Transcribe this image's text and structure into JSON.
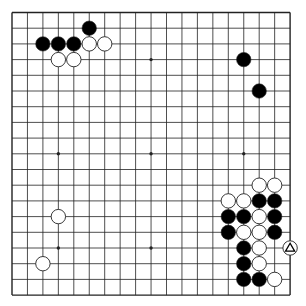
{
  "board": {
    "size": 19,
    "origin_x": 12,
    "origin_y": 12.5,
    "step_x": 15.45,
    "step_y": 15.7,
    "stone_radius": 7.2,
    "colors": {
      "background": "#ffffff",
      "line": "#222222",
      "black": "#000000",
      "white": "#ffffff",
      "stone_outline": "#222222"
    },
    "star_points": [
      [
        3,
        3
      ],
      [
        9,
        3
      ],
      [
        15,
        3
      ],
      [
        3,
        9
      ],
      [
        9,
        9
      ],
      [
        15,
        9
      ],
      [
        3,
        15
      ],
      [
        9,
        15
      ],
      [
        15,
        15
      ]
    ],
    "stones": [
      {
        "color": "black",
        "col": 5,
        "row": 1
      },
      {
        "color": "black",
        "col": 2,
        "row": 2
      },
      {
        "color": "black",
        "col": 3,
        "row": 2
      },
      {
        "color": "black",
        "col": 4,
        "row": 2
      },
      {
        "color": "white",
        "col": 5,
        "row": 2
      },
      {
        "color": "white",
        "col": 6,
        "row": 2
      },
      {
        "color": "white",
        "col": 3,
        "row": 3
      },
      {
        "color": "white",
        "col": 4,
        "row": 3
      },
      {
        "color": "black",
        "col": 15,
        "row": 3
      },
      {
        "color": "black",
        "col": 16,
        "row": 5
      },
      {
        "color": "white",
        "col": 16,
        "row": 11
      },
      {
        "color": "white",
        "col": 17,
        "row": 11
      },
      {
        "color": "white",
        "col": 14,
        "row": 12
      },
      {
        "color": "white",
        "col": 15,
        "row": 12
      },
      {
        "color": "black",
        "col": 16,
        "row": 12
      },
      {
        "color": "black",
        "col": 17,
        "row": 12
      },
      {
        "color": "black",
        "col": 14,
        "row": 13
      },
      {
        "color": "black",
        "col": 15,
        "row": 13
      },
      {
        "color": "white",
        "col": 16,
        "row": 13
      },
      {
        "color": "black",
        "col": 17,
        "row": 13
      },
      {
        "color": "black",
        "col": 14,
        "row": 14
      },
      {
        "color": "white",
        "col": 15,
        "row": 14
      },
      {
        "color": "white",
        "col": 16,
        "row": 14
      },
      {
        "color": "black",
        "col": 17,
        "row": 14
      },
      {
        "color": "black",
        "col": 15,
        "row": 15
      },
      {
        "color": "white",
        "col": 16,
        "row": 15
      },
      {
        "color": "white",
        "col": 18,
        "row": 15,
        "marker": "triangle"
      },
      {
        "color": "black",
        "col": 15,
        "row": 16
      },
      {
        "color": "white",
        "col": 16,
        "row": 16
      },
      {
        "color": "black",
        "col": 15,
        "row": 17
      },
      {
        "color": "black",
        "col": 16,
        "row": 17
      },
      {
        "color": "white",
        "col": 17,
        "row": 17
      },
      {
        "color": "white",
        "col": 3,
        "row": 13
      },
      {
        "color": "white",
        "col": 2,
        "row": 16
      }
    ]
  }
}
